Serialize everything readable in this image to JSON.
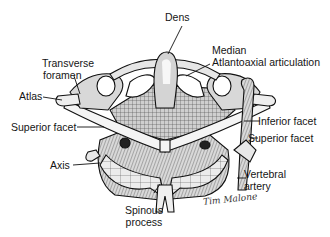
{
  "figure": {
    "type": "anatomical-illustration"
  },
  "labels": {
    "dens": "Dens",
    "median_line1": "Median",
    "median_line2": "Atlantoaxial articulation",
    "transverse_line1": "Transverse",
    "transverse_line2": "foramen",
    "atlas": "Atlas",
    "superior_facet_left": "Superior facet",
    "inferior_facet": "Inferior facet",
    "superior_facet_right": "Superior facet",
    "axis": "Axis",
    "vertebral_line1": "Vertebral",
    "vertebral_line2": "artery",
    "spinous_line1": "Spinous",
    "spinous_line2": "process"
  },
  "signature": "Tim Malone",
  "colors": {
    "ink": "#151515",
    "bone_light": "#f2f2f2",
    "bone_shade": "#bdbdbd",
    "bone_dark": "#6f6f6f",
    "background": "#ffffff"
  }
}
